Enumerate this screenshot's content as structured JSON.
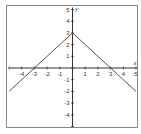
{
  "chart_data": {
    "type": "line",
    "title": "",
    "xlabel": "x",
    "ylabel": "y",
    "xlim": [
      -5,
      5
    ],
    "ylim": [
      -5,
      5
    ],
    "grid": false,
    "x_ticks": [
      -4,
      -3,
      -2,
      -1,
      1,
      2,
      3,
      4,
      5
    ],
    "y_ticks": [
      5,
      4,
      3,
      2,
      1,
      -1,
      -2,
      -3,
      -4
    ],
    "series": [
      {
        "name": "y = 3 - |x|",
        "x": [
          -5,
          0,
          5
        ],
        "y": [
          -2,
          3,
          -2
        ]
      }
    ],
    "annotations": []
  },
  "colors": {
    "axis": "#333333",
    "line": "#555555",
    "frame": "#888888"
  }
}
